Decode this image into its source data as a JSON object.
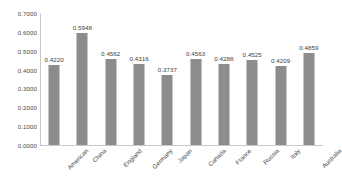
{
  "chart_data": {
    "type": "bar",
    "title": "",
    "subtitle": "",
    "xlabel": "",
    "ylabel": "",
    "categories": [
      "American",
      "China",
      "England",
      "Germany",
      "Japan",
      "Canada",
      "France",
      "Russia",
      "Italy",
      "Australia"
    ],
    "values": [
      0.422,
      0.5948,
      0.4562,
      0.4316,
      0.3737,
      0.4563,
      0.4288,
      0.4525,
      0.4209,
      0.4859
    ],
    "value_labels": [
      "0.4220",
      "0.5948",
      "0.4562",
      "0.4316",
      "0.3737",
      "0.4563",
      "0.4288",
      "0.4525",
      "0.4209",
      "0.4859"
    ],
    "ylim": [
      0.0,
      0.7
    ],
    "ytick_values": [
      0.0,
      0.1,
      0.2,
      0.3,
      0.4,
      0.5,
      0.6,
      0.7
    ],
    "ytick_labels": [
      "0.0000",
      "0.1000",
      "0.2000",
      "0.3000",
      "0.4000",
      "0.5000",
      "0.6000",
      "0.7000"
    ],
    "grid": false,
    "legend": null,
    "legend_position": "none",
    "series_color": "#8c8c8c",
    "axis_color": "#c8c8c8",
    "text_color": "#4a4a4a",
    "xtick_rotation": -45
  }
}
